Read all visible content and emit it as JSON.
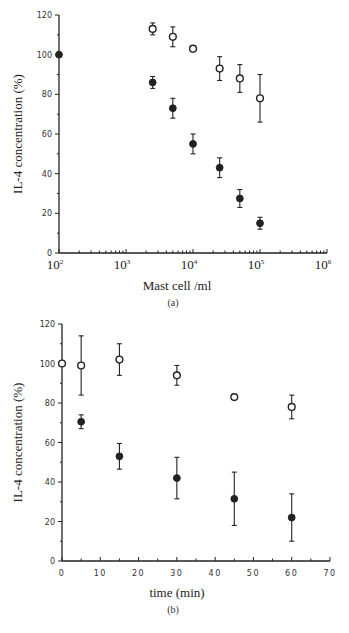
{
  "chart_data": [
    {
      "type": "scatter",
      "panel_label": "(a)",
      "title": "",
      "xlabel": "Mast cell /ml",
      "ylabel": "IL-4 concentration (%)",
      "xscale": "log",
      "xlim": [
        100,
        1000000
      ],
      "ylim": [
        0,
        120
      ],
      "xticks": [
        "10^2",
        "10^3",
        "10^4",
        "10^5",
        "10^6"
      ],
      "yticks": [
        0,
        20,
        40,
        60,
        80,
        100,
        120
      ],
      "grid": false,
      "legend": null,
      "series": [
        {
          "name": "open circles",
          "marker": "open-circle",
          "x": [
            2500,
            5000,
            10000,
            25000,
            50000,
            100000
          ],
          "y": [
            113,
            109,
            103,
            93,
            88,
            78
          ],
          "err": [
            3,
            5,
            1.5,
            6,
            7,
            12
          ]
        },
        {
          "name": "filled circles",
          "marker": "filled-circle",
          "x": [
            100,
            2500,
            5000,
            10000,
            25000,
            50000,
            100000
          ],
          "y": [
            100,
            86,
            73,
            55,
            43,
            27.5,
            15
          ],
          "err": [
            0,
            3,
            5,
            5,
            5,
            4.5,
            3
          ]
        }
      ]
    },
    {
      "type": "scatter",
      "panel_label": "(b)",
      "title": "",
      "xlabel": "time (min)",
      "ylabel": "IL-4 concentration (%)",
      "xscale": "linear",
      "xlim": [
        0,
        70
      ],
      "ylim": [
        0,
        120
      ],
      "xticks": [
        0,
        10,
        20,
        30,
        40,
        50,
        60,
        70
      ],
      "yticks": [
        0,
        20,
        40,
        60,
        80,
        100,
        120
      ],
      "grid": false,
      "legend": null,
      "series": [
        {
          "name": "open circles",
          "marker": "open-circle",
          "x": [
            0,
            5,
            15,
            30,
            45,
            60
          ],
          "y": [
            100,
            99,
            102,
            94,
            83,
            78
          ],
          "err": [
            0,
            15,
            8,
            5,
            0,
            6
          ]
        },
        {
          "name": "filled circles",
          "marker": "filled-circle",
          "x": [
            5,
            15,
            30,
            45,
            60
          ],
          "y": [
            70.5,
            53,
            42,
            31.5,
            22
          ],
          "err": [
            3.5,
            6.5,
            10.5,
            13.5,
            12
          ]
        }
      ]
    }
  ],
  "layout": [
    {
      "x0": 59,
      "x1": 327,
      "y0": 253,
      "y1": 15,
      "caption_y": 306,
      "xlabel_y": 290
    },
    {
      "x0": 62,
      "x1": 330,
      "y0": 561,
      "y1": 324,
      "caption_y": 613,
      "xlabel_y": 597
    }
  ]
}
